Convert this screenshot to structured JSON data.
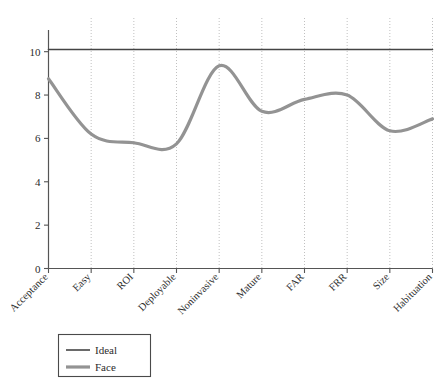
{
  "chart_data": {
    "type": "line",
    "title": "",
    "xlabel": "",
    "ylabel": "",
    "categories": [
      "Acceptance",
      "Easy",
      "ROI",
      "Deployable",
      "Noninvasive",
      "Mature",
      "FAR",
      "FRR",
      "Size",
      "Habituation"
    ],
    "series": [
      {
        "name": "Ideal",
        "values": [
          10.1,
          10.1,
          10.1,
          10.1,
          10.1,
          10.1,
          10.1,
          10.1,
          10.1,
          10.1
        ],
        "color": "#444444",
        "width": 1.6,
        "style": "straight"
      },
      {
        "name": "Face",
        "values": [
          8.75,
          6.2,
          5.8,
          5.75,
          9.35,
          7.25,
          7.8,
          8.0,
          6.35,
          6.9
        ],
        "color": "#939393",
        "width": 3.2,
        "style": "smooth"
      }
    ],
    "ylim": [
      0,
      11
    ],
    "xlim": [
      0,
      9
    ],
    "yticks": [
      0,
      2,
      4,
      6,
      8,
      10
    ],
    "ytick_labels": [
      "0",
      "2",
      "4",
      "6",
      "8",
      "10"
    ],
    "grid": {
      "vertical": true,
      "horizontal": false,
      "style": "dotted",
      "color": "#b9b9b9"
    },
    "axis_color": "#555555",
    "legend": {
      "position": "bottom-left",
      "entries": [
        {
          "label": "Ideal",
          "color": "#444444",
          "width": 1.6
        },
        {
          "label": "Face",
          "color": "#939393",
          "width": 3.2
        }
      ]
    }
  }
}
